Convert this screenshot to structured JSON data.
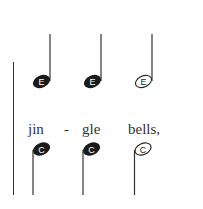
{
  "score": {
    "top_notes": [
      {
        "name": "E",
        "type": "quarter",
        "filled": true
      },
      {
        "name": "E",
        "type": "quarter",
        "filled": true
      },
      {
        "name": "E",
        "type": "half",
        "filled": false
      }
    ],
    "bottom_notes": [
      {
        "name": "C",
        "type": "quarter",
        "filled": true
      },
      {
        "name": "C",
        "type": "quarter",
        "filled": true
      },
      {
        "name": "C",
        "type": "half",
        "filled": false
      }
    ],
    "lyrics": [
      {
        "text": "jin",
        "x": 28
      },
      {
        "text": "-",
        "x": 64
      },
      {
        "text": "gle",
        "x": 82
      },
      {
        "text": "bells,",
        "x": 128
      }
    ],
    "colors": {
      "ink": "#222222",
      "background": "#ffffff"
    }
  }
}
